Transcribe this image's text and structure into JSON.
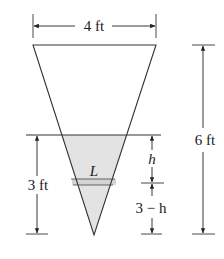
{
  "figure": {
    "type": "inverted triangular tank cross-section",
    "colors": {
      "line": "#333333",
      "water_fill": "#e3e3e3",
      "background": "#ffffff"
    },
    "labels": {
      "top_width": "4 ft",
      "total_height": "6 ft",
      "water_depth": "3 ft",
      "strip_length": "L",
      "strip_height_above": "h",
      "strip_height_below": "3 − h"
    }
  }
}
